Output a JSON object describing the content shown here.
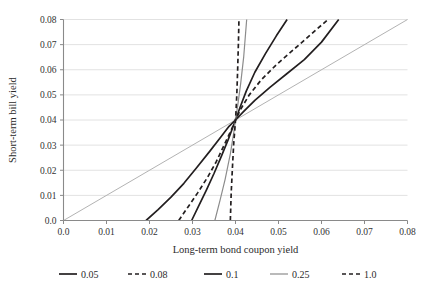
{
  "chart_data": {
    "type": "line",
    "title": "",
    "xlabel": "Long-term bond coupon yield",
    "ylabel": "Short-term bill yield",
    "xlim": [
      0.0,
      0.08
    ],
    "ylim": [
      0.0,
      0.08
    ],
    "xticks": [
      "0.0",
      "0.01",
      "0.02",
      "0.03",
      "0.04",
      "0.05",
      "0.06",
      "0.07",
      "0.08"
    ],
    "yticks": [
      "0.0",
      "0.01",
      "0.02",
      "0.03",
      "0.04",
      "0.05",
      "0.06",
      "0.07",
      "0.08"
    ],
    "xtick_values": [
      0.0,
      0.01,
      0.02,
      0.03,
      0.04,
      0.05,
      0.06,
      0.07,
      0.08
    ],
    "ytick_values": [
      0.0,
      0.01,
      0.02,
      0.03,
      0.04,
      0.05,
      0.06,
      0.07,
      0.08
    ],
    "grid": "horizontal",
    "legend_position": "bottom",
    "common_intersection": [
      0.04,
      0.04
    ],
    "series": [
      {
        "name": "0.05",
        "style": "solid",
        "color": "#231f20",
        "width": 1.7,
        "points": [
          [
            0.0192,
            0.0
          ],
          [
            0.022,
            0.0043
          ],
          [
            0.025,
            0.0093
          ],
          [
            0.028,
            0.0148
          ],
          [
            0.031,
            0.0211
          ],
          [
            0.034,
            0.0275
          ],
          [
            0.0365,
            0.033
          ],
          [
            0.0385,
            0.0375
          ],
          [
            0.04,
            0.04
          ],
          [
            0.0418,
            0.0432
          ],
          [
            0.0445,
            0.0478
          ],
          [
            0.048,
            0.053
          ],
          [
            0.052,
            0.0585
          ],
          [
            0.056,
            0.064
          ],
          [
            0.06,
            0.071
          ],
          [
            0.064,
            0.08
          ]
        ]
      },
      {
        "name": "0.08",
        "style": "dashed",
        "color": "#231f20",
        "width": 1.7,
        "points": [
          [
            0.0268,
            0.0
          ],
          [
            0.029,
            0.0055
          ],
          [
            0.0312,
            0.011
          ],
          [
            0.0335,
            0.0172
          ],
          [
            0.0355,
            0.0233
          ],
          [
            0.0375,
            0.0305
          ],
          [
            0.039,
            0.036
          ],
          [
            0.04,
            0.04
          ],
          [
            0.0412,
            0.0443
          ],
          [
            0.0432,
            0.05
          ],
          [
            0.046,
            0.056
          ],
          [
            0.0495,
            0.062
          ],
          [
            0.0535,
            0.068
          ],
          [
            0.0575,
            0.074
          ],
          [
            0.0615,
            0.08
          ]
        ]
      },
      {
        "name": "0.1",
        "style": "solid",
        "color": "#231f20",
        "width": 1.7,
        "points": [
          [
            0.0298,
            0.0
          ],
          [
            0.0315,
            0.006
          ],
          [
            0.0332,
            0.012
          ],
          [
            0.035,
            0.0187
          ],
          [
            0.0367,
            0.0255
          ],
          [
            0.0383,
            0.0322
          ],
          [
            0.0393,
            0.0367
          ],
          [
            0.04,
            0.04
          ],
          [
            0.041,
            0.0448
          ],
          [
            0.0425,
            0.0515
          ],
          [
            0.0445,
            0.059
          ],
          [
            0.047,
            0.0665
          ],
          [
            0.0495,
            0.0735
          ],
          [
            0.052,
            0.08
          ]
        ]
      },
      {
        "name": "0.25",
        "style": "solid",
        "color": "#8c8c8c",
        "width": 1.2,
        "points": [
          [
            0.0352,
            0.0
          ],
          [
            0.0364,
            0.008
          ],
          [
            0.0376,
            0.0165
          ],
          [
            0.0388,
            0.0265
          ],
          [
            0.0396,
            0.035
          ],
          [
            0.04,
            0.04
          ],
          [
            0.0405,
            0.0455
          ],
          [
            0.0412,
            0.0545
          ],
          [
            0.0419,
            0.065
          ],
          [
            0.0426,
            0.08
          ]
        ]
      },
      {
        "name": "1.0",
        "style": "dashed",
        "color": "#231f20",
        "width": 1.7,
        "points": [
          [
            0.0388,
            0.0
          ],
          [
            0.039,
            0.011
          ],
          [
            0.0393,
            0.0215
          ],
          [
            0.0396,
            0.031
          ],
          [
            0.0399,
            0.0375
          ],
          [
            0.04,
            0.04
          ],
          [
            0.0401,
            0.0428
          ],
          [
            0.0403,
            0.05
          ],
          [
            0.0405,
            0.06
          ],
          [
            0.0407,
            0.072
          ],
          [
            0.0408,
            0.08
          ]
        ]
      }
    ],
    "reference_line": {
      "name": "45-degree-line",
      "color": "#b3b3b3",
      "width": 1.0,
      "points": [
        [
          0.0,
          0.0
        ],
        [
          0.08,
          0.08
        ]
      ]
    },
    "legend": [
      {
        "label": "0.05",
        "style": "solid",
        "color": "#231f20"
      },
      {
        "label": "0.08",
        "style": "dashed",
        "color": "#231f20"
      },
      {
        "label": "0.1",
        "style": "solid",
        "color": "#231f20"
      },
      {
        "label": "0.25",
        "style": "solid",
        "color": "#8c8c8c"
      },
      {
        "label": "1.0",
        "style": "dashed",
        "color": "#231f20"
      }
    ]
  },
  "colors": {
    "grid": "#e2e2e2",
    "axis": "#8a8a8a",
    "text": "#2b2b2b",
    "series_dark": "#231f20",
    "series_gray": "#8c8c8c",
    "reference": "#b3b3b3",
    "background": "#ffffff"
  }
}
